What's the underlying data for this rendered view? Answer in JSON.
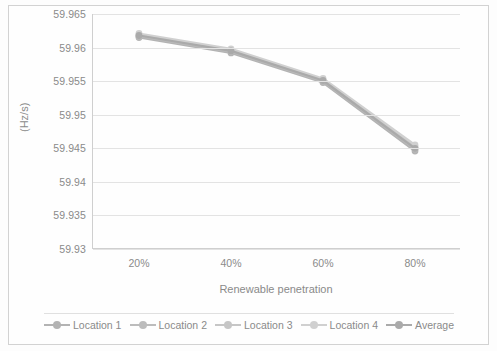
{
  "chart_data": {
    "type": "line",
    "title": "",
    "xlabel": "Renewable penetration",
    "ylabel": "(Hz/s)",
    "categories": [
      "20%",
      "40%",
      "60%",
      "80%"
    ],
    "ylim": [
      59.93,
      59.965
    ],
    "yticks": [
      "59.93",
      "59.935",
      "59.94",
      "59.945",
      "59.95",
      "59.955",
      "59.96",
      "59.965"
    ],
    "ytick_values": [
      59.93,
      59.935,
      59.94,
      59.945,
      59.95,
      59.955,
      59.96,
      59.965
    ],
    "grid": true,
    "legend_position": "bottom",
    "series": [
      {
        "name": "Location 1",
        "color": "#b3b3b3",
        "values": [
          59.9615,
          59.9592,
          59.9548,
          59.9446
        ]
      },
      {
        "name": "Location 2",
        "color": "#bcbcbc",
        "values": [
          59.9617,
          59.9594,
          59.955,
          59.9449
        ]
      },
      {
        "name": "Location 3",
        "color": "#c6c6c6",
        "values": [
          59.9619,
          59.9596,
          59.9552,
          59.9452
        ]
      },
      {
        "name": "Location 4",
        "color": "#d0d0d0",
        "values": [
          59.9621,
          59.9598,
          59.9554,
          59.9455
        ]
      },
      {
        "name": "Average",
        "color": "#aaaaaa",
        "values": [
          59.9618,
          59.9595,
          59.9551,
          59.945
        ]
      }
    ]
  },
  "legend": {
    "items": [
      {
        "label": "Location 1"
      },
      {
        "label": "Location 2"
      },
      {
        "label": "Location 3"
      },
      {
        "label": "Location 4"
      },
      {
        "label": "Average"
      }
    ]
  }
}
